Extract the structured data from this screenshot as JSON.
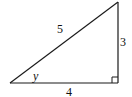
{
  "diagram": {
    "type": "right-triangle",
    "colors": {
      "stroke": "#1a1a1a",
      "background": "#ffffff"
    },
    "vertices": {
      "bottom_left": [
        10,
        83
      ],
      "bottom_right": [
        118,
        83
      ],
      "top_right": [
        118,
        2
      ]
    },
    "right_angle_marker": {
      "at": "bottom_right",
      "size": 6
    },
    "sides": {
      "hypotenuse": {
        "label": "5",
        "label_pos": [
          60,
          33
        ]
      },
      "vertical_leg": {
        "label": "3",
        "label_pos": [
          122,
          46
        ]
      },
      "horizontal_leg": {
        "label": "4",
        "label_pos": [
          69,
          95
        ]
      }
    },
    "angle": {
      "label": "y",
      "at": "bottom_left",
      "label_pos": [
        34,
        80
      ]
    }
  }
}
